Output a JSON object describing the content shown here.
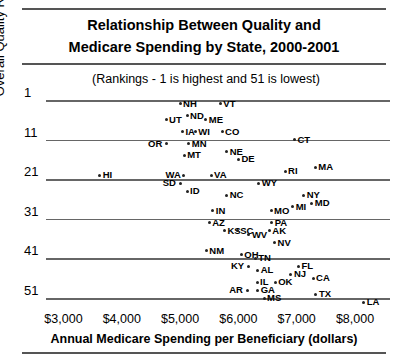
{
  "header": {
    "title_line1": "Relationship Between Quality and",
    "title_line2": "Medicare Spending by State, 2000-2001",
    "subtitle": "(Rankings - 1 is highest and 51 is lowest)"
  },
  "axes": {
    "ytitle": "Overall Quality Ranking",
    "xtitle": "Annual Medicare Spending per Beneficiary (dollars)",
    "yticks": [
      "1",
      "11",
      "21",
      "31",
      "41",
      "51"
    ],
    "xticks": [
      "$3,000",
      "$4,000",
      "$5,000",
      "$6,000",
      "$7,000",
      "$8,000"
    ]
  },
  "chart_data": {
    "type": "scatter",
    "title": "Relationship Between Quality and Medicare Spending by State, 2000-2001",
    "subtitle": "(Rankings - 1 is highest and 51 is lowest)",
    "xlabel": "Annual Medicare Spending per Beneficiary (dollars)",
    "ylabel": "Overall Quality Ranking",
    "xlim": [
      2700,
      8600
    ],
    "ylim": [
      1,
      53
    ],
    "y_inverted": true,
    "grid": "horizontal",
    "legend": "none",
    "xticks": [
      3000,
      4000,
      5000,
      6000,
      7000,
      8000
    ],
    "yticks": [
      1,
      11,
      21,
      31,
      41,
      51
    ],
    "points": [
      {
        "label": "NH",
        "x": 5000,
        "y": 2
      },
      {
        "label": "VT",
        "x": 5690,
        "y": 2
      },
      {
        "label": "UT",
        "x": 4760,
        "y": 6
      },
      {
        "label": "ND",
        "x": 5120,
        "y": 5
      },
      {
        "label": "ME",
        "x": 5440,
        "y": 6
      },
      {
        "label": "IA",
        "x": 5040,
        "y": 9
      },
      {
        "label": "WI",
        "x": 5260,
        "y": 9
      },
      {
        "label": "CO",
        "x": 5720,
        "y": 9
      },
      {
        "label": "OR",
        "x": 4760,
        "y": 12
      },
      {
        "label": "MN",
        "x": 5150,
        "y": 12
      },
      {
        "label": "CT",
        "x": 6960,
        "y": 11
      },
      {
        "label": "MT",
        "x": 5070,
        "y": 15
      },
      {
        "label": "NE",
        "x": 5800,
        "y": 14
      },
      {
        "label": "DE",
        "x": 6000,
        "y": 16
      },
      {
        "label": "HI",
        "x": 3620,
        "y": 20
      },
      {
        "label": "RI",
        "x": 6800,
        "y": 19
      },
      {
        "label": "MA",
        "x": 7320,
        "y": 18
      },
      {
        "label": "WA",
        "x": 5060,
        "y": 20
      },
      {
        "label": "VA",
        "x": 5530,
        "y": 20
      },
      {
        "label": "SD",
        "x": 5010,
        "y": 22
      },
      {
        "label": "ID",
        "x": 5120,
        "y": 24
      },
      {
        "label": "WY",
        "x": 6350,
        "y": 22
      },
      {
        "label": "NC",
        "x": 5800,
        "y": 25
      },
      {
        "label": "NY",
        "x": 7120,
        "y": 25
      },
      {
        "label": "MD",
        "x": 7260,
        "y": 27
      },
      {
        "label": "MI",
        "x": 6930,
        "y": 28
      },
      {
        "label": "IN",
        "x": 5560,
        "y": 29
      },
      {
        "label": "MO",
        "x": 6560,
        "y": 29
      },
      {
        "label": "AZ",
        "x": 5500,
        "y": 32
      },
      {
        "label": "PA",
        "x": 6570,
        "y": 32
      },
      {
        "label": "KS",
        "x": 5760,
        "y": 34
      },
      {
        "label": "SC",
        "x": 5980,
        "y": 34
      },
      {
        "label": "WV",
        "x": 6180,
        "y": 35
      },
      {
        "label": "AK",
        "x": 6530,
        "y": 34
      },
      {
        "label": "NV",
        "x": 6620,
        "y": 37
      },
      {
        "label": "NM",
        "x": 5450,
        "y": 39
      },
      {
        "label": "OH",
        "x": 6050,
        "y": 40
      },
      {
        "label": "TN",
        "x": 6290,
        "y": 41
      },
      {
        "label": "KY",
        "x": 6180,
        "y": 43
      },
      {
        "label": "AL",
        "x": 6330,
        "y": 44
      },
      {
        "label": "FL",
        "x": 7030,
        "y": 43
      },
      {
        "label": "NJ",
        "x": 6900,
        "y": 45
      },
      {
        "label": "CA",
        "x": 7280,
        "y": 46
      },
      {
        "label": "IL",
        "x": 6320,
        "y": 47
      },
      {
        "label": "OK",
        "x": 6630,
        "y": 47
      },
      {
        "label": "AR",
        "x": 6150,
        "y": 49
      },
      {
        "label": "GA",
        "x": 6330,
        "y": 49
      },
      {
        "label": "MS",
        "x": 6440,
        "y": 51
      },
      {
        "label": "TX",
        "x": 7330,
        "y": 50
      },
      {
        "label": "LA",
        "x": 8150,
        "y": 52
      }
    ]
  }
}
